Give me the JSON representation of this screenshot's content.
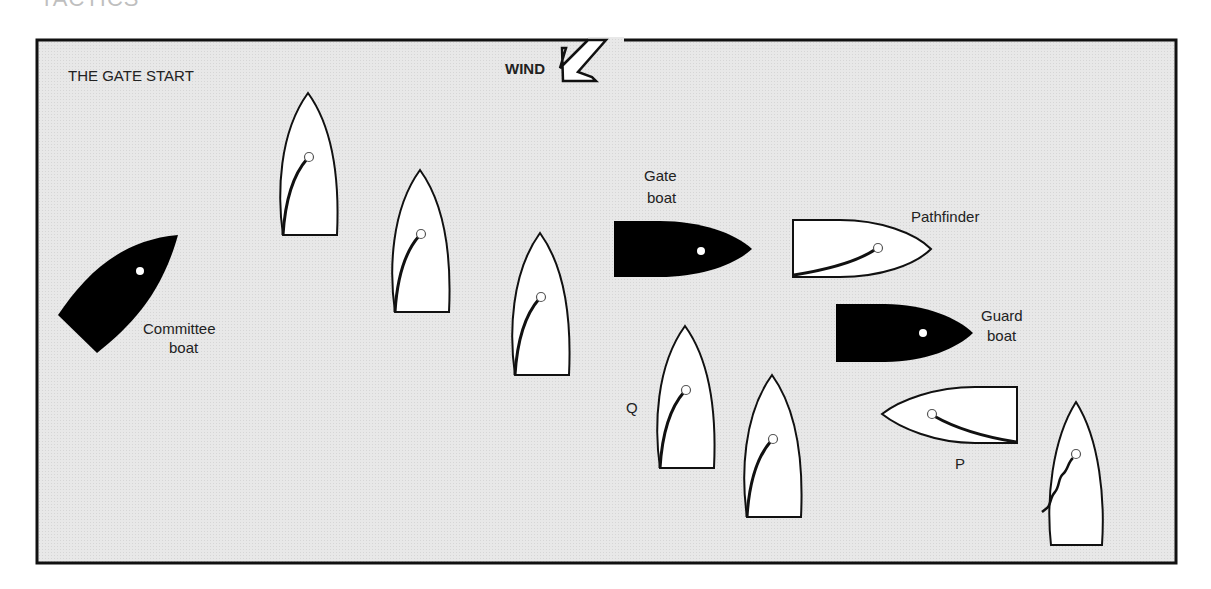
{
  "heading_cropped": "TACTICS",
  "diagram": {
    "title": "THE GATE START",
    "wind_label": "WIND",
    "background_color": "#e6e6e6",
    "frame_color": "#111111",
    "labels": {
      "committee_line1": "Committee",
      "committee_line2": "boat",
      "gate_line1": "Gate",
      "gate_line2": "boat",
      "pathfinder": "Pathfinder",
      "guard_line1": "Guard",
      "guard_line2": "boat",
      "q": "Q",
      "p": "P"
    },
    "boats": [
      {
        "id": "committee-boat",
        "fill": "black",
        "orientation": "diagonal-up-right"
      },
      {
        "id": "dinghy-1",
        "fill": "white",
        "orientation": "up"
      },
      {
        "id": "dinghy-2",
        "fill": "white",
        "orientation": "up"
      },
      {
        "id": "dinghy-3",
        "fill": "white",
        "orientation": "up"
      },
      {
        "id": "gate-boat",
        "fill": "black",
        "orientation": "right"
      },
      {
        "id": "pathfinder",
        "fill": "white",
        "orientation": "right"
      },
      {
        "id": "guard-boat",
        "fill": "black",
        "orientation": "right"
      },
      {
        "id": "dinghy-q",
        "fill": "white",
        "orientation": "up"
      },
      {
        "id": "dinghy-4",
        "fill": "white",
        "orientation": "up"
      },
      {
        "id": "dinghy-p",
        "fill": "white",
        "orientation": "left"
      },
      {
        "id": "dinghy-luffing",
        "fill": "white",
        "orientation": "up",
        "sail": "luffing"
      }
    ]
  }
}
